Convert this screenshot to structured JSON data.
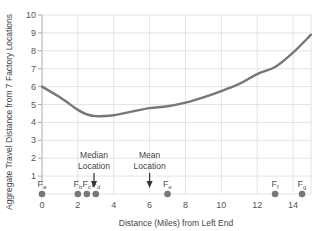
{
  "chart_data": {
    "type": "line",
    "title": "",
    "xlabel": "Distance (Miles) from Left End",
    "ylabel": "Aggregate Travel Distance from 7 Factory Locations",
    "xlim": [
      0,
      15
    ],
    "ylim": [
      0,
      10
    ],
    "x_ticks": [
      0,
      2,
      4,
      6,
      8,
      10,
      12,
      14
    ],
    "y_ticks": [
      1,
      2,
      3,
      4,
      5,
      6,
      7,
      8,
      9,
      10
    ],
    "grid": true,
    "series": [
      {
        "name": "Aggregate travel distance",
        "color": "#777777",
        "x": [
          0,
          1,
          2,
          2.5,
          3,
          4,
          5,
          6,
          7,
          8,
          9,
          10,
          11,
          12,
          13,
          14,
          15
        ],
        "y": [
          6.0,
          5.4,
          4.7,
          4.45,
          4.35,
          4.4,
          4.6,
          4.8,
          4.9,
          5.1,
          5.4,
          5.75,
          6.15,
          6.7,
          7.1,
          7.9,
          8.9
        ]
      }
    ],
    "factories": [
      {
        "label": "F",
        "sub": "a",
        "x": 0
      },
      {
        "label": "F",
        "sub": "b",
        "x": 2
      },
      {
        "label": "F",
        "sub": "c",
        "x": 2.5
      },
      {
        "label": "F",
        "sub": "d",
        "x": 3
      },
      {
        "label": "F",
        "sub": "e",
        "x": 7
      },
      {
        "label": "F",
        "sub": "f",
        "x": 13
      },
      {
        "label": "F",
        "sub": "g",
        "x": 14.5
      }
    ],
    "annotations": [
      {
        "text_lines": [
          "Median",
          "Location"
        ],
        "x": 2.9,
        "type": "arrow-down"
      },
      {
        "text_lines": [
          "Mean",
          "Location"
        ],
        "x": 6.0,
        "type": "arrow-down"
      }
    ],
    "factory_marker_color": "#777777"
  }
}
